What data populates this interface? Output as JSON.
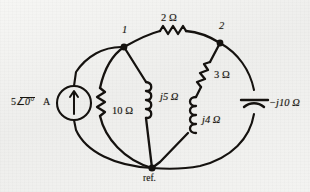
{
  "figure": {
    "kind": "circuit-diagram",
    "title": "",
    "background_color": "#f2f2f0",
    "ink_color": "#15120f"
  },
  "nodes": [
    {
      "id": "n1",
      "label": "1",
      "name": "node-1-label"
    },
    {
      "id": "n2",
      "label": "2",
      "name": "node-2-label"
    },
    {
      "id": "ref",
      "label": "ref.",
      "name": "reference-node-label"
    }
  ],
  "source": {
    "magnitude": "5",
    "angle": "0°",
    "unit": "A",
    "symbol": "current-source",
    "arrow_direction": "up"
  },
  "components": [
    {
      "id": "r2",
      "label": "2 Ω",
      "type": "resistor",
      "between": [
        "1",
        "2"
      ]
    },
    {
      "id": "r3",
      "label": "3 Ω",
      "type": "resistor",
      "between": [
        "2",
        "ref"
      ]
    },
    {
      "id": "r10",
      "label": "10 Ω",
      "type": "resistor",
      "between": [
        "1",
        "ref"
      ]
    },
    {
      "id": "l5",
      "label": "j5 Ω",
      "type": "inductor",
      "between": [
        "1",
        "ref"
      ]
    },
    {
      "id": "l4",
      "label": "j4 Ω",
      "type": "inductor",
      "between": [
        "2",
        "ref"
      ]
    },
    {
      "id": "c10",
      "label": "−j10 Ω",
      "type": "capacitor",
      "between": [
        "2",
        "ref"
      ]
    }
  ]
}
